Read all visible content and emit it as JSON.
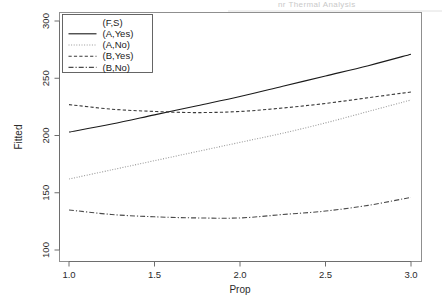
{
  "figure": {
    "header_ghost": "nr Thermal Analysis",
    "background_color": "#ffffff",
    "ink_color": "#1a1a1a"
  },
  "chart_data": {
    "type": "line",
    "title": "",
    "subtitle": "",
    "xlabel": "Prop",
    "ylabel": "Fitted",
    "xlim": [
      1.0,
      3.0
    ],
    "ylim": [
      100,
      300
    ],
    "xticks": [
      1.0,
      1.5,
      2.0,
      2.5,
      3.0
    ],
    "xtick_labels": [
      "1.0",
      "1.5",
      "2.0",
      "2.5",
      "3.0"
    ],
    "yticks": [
      100,
      150,
      200,
      250,
      300
    ],
    "ytick_labels": [
      "100",
      "150",
      "200",
      "250",
      "300"
    ],
    "grid": false,
    "legend": {
      "title": "(F,S)",
      "position": "top-left-inside",
      "entries": [
        {
          "label": "(A,Yes)",
          "linestyle": "solid",
          "color": "#1a1a1a"
        },
        {
          "label": "(A,No)",
          "linestyle": "dotted",
          "color": "#9a9a9a"
        },
        {
          "label": "(B,Yes)",
          "linestyle": "dashed",
          "color": "#3a3a3a"
        },
        {
          "label": "(B,No)",
          "linestyle": "dashdot",
          "color": "#4a4a4a"
        }
      ]
    },
    "x": [
      1.0,
      1.25,
      1.5,
      1.75,
      2.0,
      2.25,
      2.5,
      2.75,
      3.0
    ],
    "series": [
      {
        "name": "(A,Yes)",
        "linestyle": "solid",
        "color": "#1a1a1a",
        "values": [
          203,
          210,
          218,
          226,
          234,
          243,
          252,
          261,
          271
        ]
      },
      {
        "name": "(A,No)",
        "linestyle": "dotted",
        "color": "#9a9a9a",
        "values": [
          162,
          170,
          178,
          186,
          194,
          202,
          211,
          221,
          231
        ]
      },
      {
        "name": "(B,Yes)",
        "linestyle": "dashed",
        "color": "#3a3a3a",
        "values": [
          227,
          223,
          221,
          220,
          221,
          224,
          228,
          233,
          238
        ]
      },
      {
        "name": "(B,No)",
        "linestyle": "dashdot",
        "color": "#4a4a4a",
        "values": [
          135,
          131,
          129,
          128,
          128,
          131,
          134,
          139,
          146
        ]
      }
    ]
  }
}
